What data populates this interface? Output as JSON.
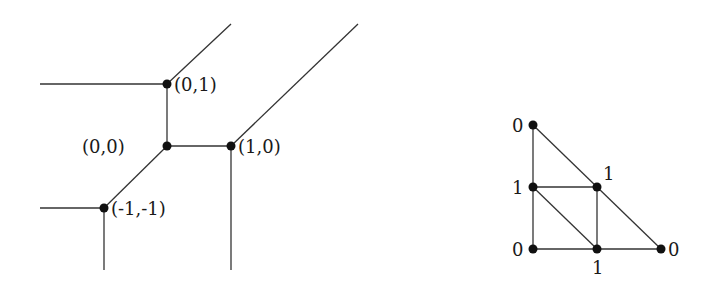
{
  "tropical_curve": {
    "vertices": [
      {
        "id": "v01",
        "label": "(0,1)",
        "x": 167,
        "y": 84,
        "lx": 174,
        "ly": 91
      },
      {
        "id": "v00",
        "label": "(0,0)",
        "x": 167,
        "y": 146,
        "lx": 82,
        "ly": 153
      },
      {
        "id": "v10",
        "label": "(1,0)",
        "x": 231,
        "y": 146,
        "lx": 238,
        "ly": 153
      },
      {
        "id": "vm1m1",
        "label": "(-1,-1)",
        "x": 104,
        "y": 208,
        "lx": 111,
        "ly": 215
      }
    ],
    "edges": [
      {
        "x1": 40,
        "y1": 84,
        "x2": 167,
        "y2": 84
      },
      {
        "x1": 167,
        "y1": 84,
        "x2": 231,
        "y2": 24
      },
      {
        "x1": 167,
        "y1": 84,
        "x2": 167,
        "y2": 146
      },
      {
        "x1": 167,
        "y1": 146,
        "x2": 231,
        "y2": 146
      },
      {
        "x1": 231,
        "y1": 146,
        "x2": 358,
        "y2": 24
      },
      {
        "x1": 231,
        "y1": 146,
        "x2": 231,
        "y2": 270
      },
      {
        "x1": 167,
        "y1": 146,
        "x2": 104,
        "y2": 208
      },
      {
        "x1": 40,
        "y1": 208,
        "x2": 104,
        "y2": 208
      },
      {
        "x1": 104,
        "y1": 208,
        "x2": 104,
        "y2": 270
      }
    ]
  },
  "subdivision": {
    "vertices": [
      {
        "id": "top",
        "label": "0",
        "x": 533,
        "y": 125,
        "lx": 512,
        "ly": 132
      },
      {
        "id": "midleft",
        "label": "1",
        "x": 533,
        "y": 187,
        "lx": 512,
        "ly": 194
      },
      {
        "id": "botleft",
        "label": "0",
        "x": 533,
        "y": 249,
        "lx": 512,
        "ly": 256
      },
      {
        "id": "mid",
        "label": "1",
        "x": 597,
        "y": 187,
        "lx": 603,
        "ly": 180
      },
      {
        "id": "botmid",
        "label": "1",
        "x": 597,
        "y": 249,
        "lx": 592,
        "ly": 274
      },
      {
        "id": "botright",
        "label": "0",
        "x": 661,
        "y": 249,
        "lx": 668,
        "ly": 256
      }
    ],
    "edges": [
      {
        "x1": 533,
        "y1": 125,
        "x2": 533,
        "y2": 249
      },
      {
        "x1": 533,
        "y1": 249,
        "x2": 661,
        "y2": 249
      },
      {
        "x1": 533,
        "y1": 125,
        "x2": 661,
        "y2": 249
      },
      {
        "x1": 533,
        "y1": 187,
        "x2": 597,
        "y2": 187
      },
      {
        "x1": 597,
        "y1": 187,
        "x2": 597,
        "y2": 249
      },
      {
        "x1": 533,
        "y1": 187,
        "x2": 597,
        "y2": 249
      }
    ]
  }
}
